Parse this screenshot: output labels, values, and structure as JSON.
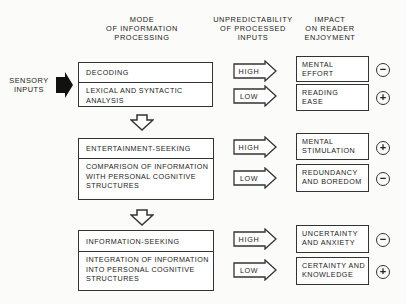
{
  "headers": {
    "mode": "MODE\nOF INFORMATION\nPROCESSING",
    "unpredictability": "UNPREDICTABILITY\nOF PROCESSED\nINPUTS",
    "impact": "IMPACT\nON READER\nENJOYMENT"
  },
  "sensory_inputs": "SENSORY\nINPUTS",
  "stages": [
    {
      "title": "DECODING",
      "description": "LEXICAL AND SYNTACTIC\nANALYSIS",
      "outcomes": [
        {
          "level": "HIGH",
          "impact": "MENTAL\nEFFORT",
          "sign": "−"
        },
        {
          "level": "LOW",
          "impact": "READING\nEASE",
          "sign": "+"
        }
      ]
    },
    {
      "title": "ENTERTAINMENT-SEEKING",
      "description": "COMPARISON OF INFORMATION\nWITH PERSONAL COGNITIVE\nSTRUCTURES",
      "outcomes": [
        {
          "level": "HIGH",
          "impact": "MENTAL\nSTIMULATION",
          "sign": "+"
        },
        {
          "level": "LOW",
          "impact": "REDUNDANCY\nAND BOREDOM",
          "sign": "−"
        }
      ]
    },
    {
      "title": "INFORMATION-SEEKING",
      "description": "INTEGRATION OF INFORMATION\nINTO PERSONAL COGNITIVE\nSTRUCTURES",
      "outcomes": [
        {
          "level": "HIGH",
          "impact": "UNCERTAINTY\nAND ANXIETY",
          "sign": "−"
        },
        {
          "level": "LOW",
          "impact": "CERTAINTY AND\nKNOWLEDGE",
          "sign": "+"
        }
      ]
    }
  ]
}
